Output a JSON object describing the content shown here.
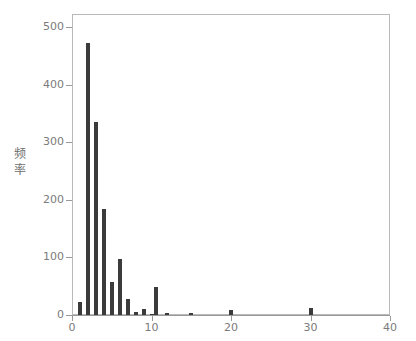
{
  "chart_data": {
    "type": "bar",
    "title": "",
    "subtitle": "",
    "xlabel": "",
    "ylabel": "频率",
    "ylabel_chars": [
      "频",
      "率"
    ],
    "xlim": [
      0,
      40
    ],
    "ylim": [
      0,
      500
    ],
    "grid": false,
    "legend": null,
    "bar_color": "#3b3b3b",
    "axis_color": "#9a9a9a",
    "frame_color": "#b9b9b9",
    "tick_label_color": "#7b7b7b",
    "xticks": [
      0,
      10,
      20,
      30,
      40
    ],
    "xtick_labels": [
      "0",
      "10",
      "20",
      "30",
      "40"
    ],
    "yticks": [
      0,
      100,
      200,
      300,
      400,
      500
    ],
    "ytick_labels": [
      "0",
      "100",
      "200",
      "300",
      "400",
      "500"
    ],
    "x": [
      1,
      2,
      3,
      4,
      5,
      6,
      7,
      8,
      9,
      10,
      10.6,
      12,
      15,
      20,
      30
    ],
    "values": [
      22,
      473,
      335,
      184,
      57,
      98,
      28,
      5,
      10,
      2,
      48,
      3,
      4,
      9,
      12
    ],
    "bars": [
      {
        "x": 1,
        "value": 22
      },
      {
        "x": 2,
        "value": 473
      },
      {
        "x": 3,
        "value": 335
      },
      {
        "x": 4,
        "value": 184
      },
      {
        "x": 5,
        "value": 57
      },
      {
        "x": 6,
        "value": 98
      },
      {
        "x": 7,
        "value": 28
      },
      {
        "x": 8,
        "value": 5
      },
      {
        "x": 9,
        "value": 10
      },
      {
        "x": 10,
        "value": 2
      },
      {
        "x": 10.6,
        "value": 48
      },
      {
        "x": 12,
        "value": 3
      },
      {
        "x": 15,
        "value": 4
      },
      {
        "x": 20,
        "value": 9
      },
      {
        "x": 30,
        "value": 12
      }
    ]
  }
}
